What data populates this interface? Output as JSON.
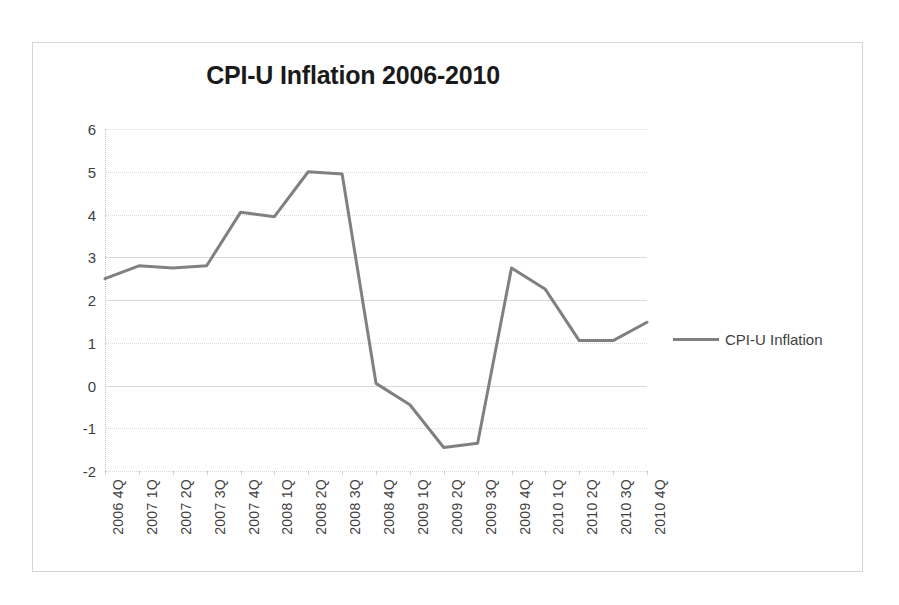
{
  "chart_data": {
    "type": "line",
    "title": "CPI-U Inflation 2006-2010",
    "xlabel": "",
    "ylabel": "",
    "ylim": [
      -2,
      6
    ],
    "yticks": [
      6,
      5,
      4,
      3,
      2,
      1,
      0,
      -1,
      -2
    ],
    "ytick_labels": [
      "6",
      "5",
      "4",
      "3",
      "2",
      "1",
      "0",
      "-1",
      "-2"
    ],
    "grid": true,
    "legend_position": "right",
    "categories": [
      "2006 4Q",
      "2007 1Q",
      "2007 2Q",
      "2007 3Q",
      "2007 4Q",
      "2008 1Q",
      "2008 2Q",
      "2008 3Q",
      "2008 4Q",
      "2009 1Q",
      "2009 2Q",
      "2009 3Q",
      "2009 4Q",
      "2010 1Q",
      "2010 2Q",
      "2010 3Q",
      "2010 4Q"
    ],
    "series": [
      {
        "name": "CPI-U Inflation",
        "color": "#808080",
        "values": [
          2.5,
          2.8,
          2.75,
          2.8,
          4.05,
          3.95,
          5.0,
          4.95,
          0.05,
          -0.45,
          -1.45,
          -1.35,
          2.75,
          2.25,
          1.05,
          1.05,
          1.48
        ]
      }
    ]
  },
  "legend": {
    "entries": [
      {
        "label": "CPI-U Inflation",
        "color": "#808080"
      }
    ]
  }
}
